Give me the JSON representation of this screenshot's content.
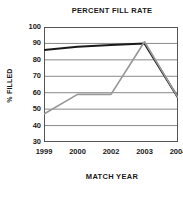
{
  "chart_data": {
    "type": "line",
    "title": "PERCENT FILL RATE",
    "xlabel": "MATCH YEAR",
    "ylabel": "% FILLED",
    "categories": [
      "1999",
      "2000",
      "2002",
      "2003",
      "2004"
    ],
    "ylim": [
      30,
      100
    ],
    "yticks": [
      100,
      90,
      80,
      70,
      60,
      50,
      40,
      30
    ],
    "ytick_labels": [
      "100",
      "90",
      "80",
      "70",
      "60",
      "50",
      "40",
      "30"
    ],
    "grid": "horizontal",
    "legend": "none",
    "series": [
      {
        "name": "dark-line",
        "color": "#1a1a1a",
        "values": [
          86,
          88,
          89,
          90,
          57
        ]
      },
      {
        "name": "gray-line",
        "color": "#999999",
        "values": [
          47,
          59,
          59,
          91,
          57
        ]
      }
    ]
  },
  "colors": {
    "axis": "#555555",
    "gridline": "#8a8a8a",
    "dark_series": "#1a1a1a",
    "gray_series": "#999999",
    "text": "#1a1a1a",
    "background": "#ffffff"
  }
}
